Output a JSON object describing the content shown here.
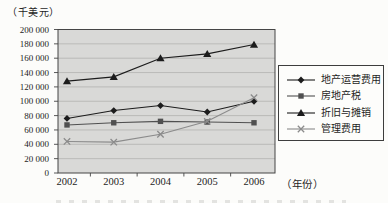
{
  "page": {
    "background": "#fcfcfa"
  },
  "chart_data": {
    "type": "line",
    "title": "",
    "y_unit_label": "（千美元）",
    "x_unit_label": "（年份）",
    "categories": [
      "2002",
      "2003",
      "2004",
      "2005",
      "2006"
    ],
    "ylim": [
      0,
      200000
    ],
    "y_tick_step": 20000,
    "y_tick_labels": [
      "0",
      "20 000",
      "40 000",
      "60 000",
      "80 000",
      "100 000",
      "120 000",
      "140 000",
      "160 000",
      "180 000",
      "200 000"
    ],
    "grid": true,
    "legend_position": "right",
    "plot_background": "#d9d9d7",
    "gridline_color": "#aeaeab",
    "frame_color": "#454545",
    "series": [
      {
        "name": "地产运营费用",
        "marker": "diamond",
        "color": "#1c1c1c",
        "values": [
          76000,
          87000,
          94000,
          85000,
          100000
        ]
      },
      {
        "name": "房地产税",
        "marker": "square",
        "color": "#505050",
        "values": [
          67000,
          70000,
          72000,
          71000,
          70000
        ]
      },
      {
        "name": "折旧与摊销",
        "marker": "triangle",
        "color": "#1c1c1c",
        "values": [
          128000,
          134000,
          160000,
          166000,
          179000
        ]
      },
      {
        "name": "管理费用",
        "marker": "x",
        "color": "#8b8b8b",
        "values": [
          44000,
          43000,
          54000,
          72000,
          105000
        ]
      }
    ]
  }
}
